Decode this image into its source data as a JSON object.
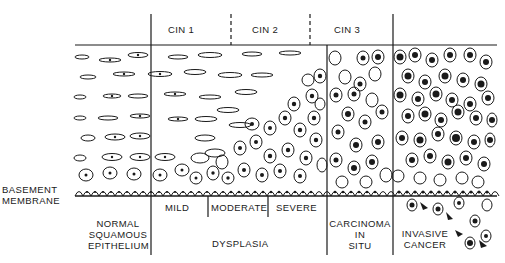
{
  "header_labels": {
    "cin1": "CIN 1",
    "cin2": "CIN 2",
    "cin3": "CIN 3"
  },
  "membrane_label": {
    "line1": "BASEMENT",
    "line2": "MEMBRANE"
  },
  "bottom_labels": {
    "normal": {
      "line1": "NORMAL",
      "line2": "SQUAMOUS",
      "line3": "EPITHELIUM"
    },
    "mild": "MILD",
    "moderate": "MODERATE",
    "severe": "SEVERE",
    "dysplasia": "DYSPLASIA",
    "cis": {
      "line1": "CARCINOMA",
      "line2": "IN",
      "line3": "SITU"
    },
    "invasive": {
      "line1": "INVASIVE",
      "line2": "CANCER"
    }
  },
  "colors": {
    "ink": "#1a1a1a",
    "background": "#ffffff"
  }
}
